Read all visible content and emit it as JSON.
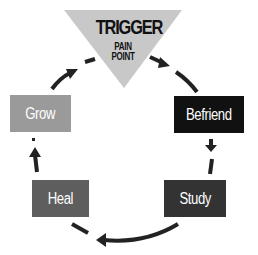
{
  "diagram": {
    "trigger": {
      "title": "TRIGGER",
      "subtitle_line1": "PAIN",
      "subtitle_line2": "POINT",
      "color": "#c8c8c8"
    },
    "stages": [
      {
        "label": "Befriend",
        "color": "#111111"
      },
      {
        "label": "Study",
        "color": "#333333"
      },
      {
        "label": "Heal",
        "color": "#5e5e5e"
      },
      {
        "label": "Grow",
        "color": "#9a9a9a"
      }
    ],
    "arrow_color": "#222222",
    "flow_direction": "clockwise"
  }
}
